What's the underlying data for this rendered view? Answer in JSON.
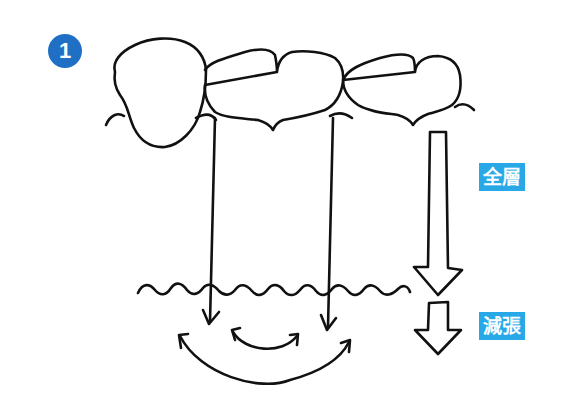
{
  "figure": {
    "step_number": "1",
    "badge_color": "#1f6fc5",
    "label_color": "#29a8e8",
    "labels": {
      "full_thickness": "全層",
      "reduced_tension": "減張"
    },
    "elements": [
      "three-teeth-crowns",
      "gingival-line",
      "two-vertical-incision-lines",
      "wavy-mucosa-line",
      "divergent-curved-arrows",
      "large-down-arrow",
      "small-down-arrow"
    ]
  }
}
